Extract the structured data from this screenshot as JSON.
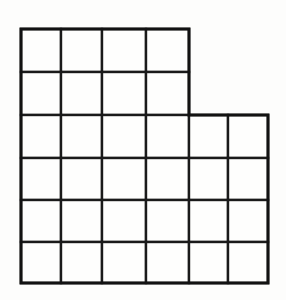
{
  "figure": {
    "name": "staircase-polyomino-grid",
    "background_color": "#fdfdfc",
    "line_color": "#1a1a1a",
    "line_width": 2.4,
    "cell_fill": "#fefefd",
    "total_cells": 32,
    "canvas": {
      "width": 286,
      "height": 300
    }
  },
  "chart_data": {
    "type": "table",
    "title": "",
    "xlabel": "",
    "ylabel": "",
    "grid": true,
    "columns": 6,
    "rows": 6,
    "column_edges_px": [
      21,
      61,
      102,
      146,
      189,
      228,
      268
    ],
    "row_edges_px": [
      29,
      72,
      115,
      158,
      200,
      242,
      283
    ],
    "row_cell_counts": [
      4,
      4,
      6,
      6,
      6,
      6
    ],
    "cells": [
      {
        "row": 0,
        "col": 0,
        "x": 21,
        "y": 29,
        "w": 40,
        "h": 43
      },
      {
        "row": 0,
        "col": 1,
        "x": 61,
        "y": 29,
        "w": 41,
        "h": 43
      },
      {
        "row": 0,
        "col": 2,
        "x": 102,
        "y": 29,
        "w": 44,
        "h": 43
      },
      {
        "row": 0,
        "col": 3,
        "x": 146,
        "y": 29,
        "w": 43,
        "h": 43
      },
      {
        "row": 1,
        "col": 0,
        "x": 21,
        "y": 72,
        "w": 40,
        "h": 43
      },
      {
        "row": 1,
        "col": 1,
        "x": 61,
        "y": 72,
        "w": 41,
        "h": 43
      },
      {
        "row": 1,
        "col": 2,
        "x": 102,
        "y": 72,
        "w": 44,
        "h": 43
      },
      {
        "row": 1,
        "col": 3,
        "x": 146,
        "y": 72,
        "w": 43,
        "h": 43
      },
      {
        "row": 2,
        "col": 0,
        "x": 21,
        "y": 115,
        "w": 40,
        "h": 43
      },
      {
        "row": 2,
        "col": 1,
        "x": 61,
        "y": 115,
        "w": 41,
        "h": 43
      },
      {
        "row": 2,
        "col": 2,
        "x": 102,
        "y": 115,
        "w": 44,
        "h": 43
      },
      {
        "row": 2,
        "col": 3,
        "x": 146,
        "y": 115,
        "w": 43,
        "h": 43
      },
      {
        "row": 2,
        "col": 4,
        "x": 189,
        "y": 115,
        "w": 39,
        "h": 43
      },
      {
        "row": 2,
        "col": 5,
        "x": 228,
        "y": 115,
        "w": 40,
        "h": 43
      },
      {
        "row": 3,
        "col": 0,
        "x": 21,
        "y": 158,
        "w": 40,
        "h": 42
      },
      {
        "row": 3,
        "col": 1,
        "x": 61,
        "y": 158,
        "w": 41,
        "h": 42
      },
      {
        "row": 3,
        "col": 2,
        "x": 102,
        "y": 158,
        "w": 44,
        "h": 42
      },
      {
        "row": 3,
        "col": 3,
        "x": 146,
        "y": 158,
        "w": 43,
        "h": 42
      },
      {
        "row": 3,
        "col": 4,
        "x": 189,
        "y": 158,
        "w": 39,
        "h": 42
      },
      {
        "row": 3,
        "col": 5,
        "x": 228,
        "y": 158,
        "w": 40,
        "h": 42
      },
      {
        "row": 4,
        "col": 0,
        "x": 21,
        "y": 200,
        "w": 40,
        "h": 42
      },
      {
        "row": 4,
        "col": 1,
        "x": 61,
        "y": 200,
        "w": 41,
        "h": 42
      },
      {
        "row": 4,
        "col": 2,
        "x": 102,
        "y": 200,
        "w": 44,
        "h": 42
      },
      {
        "row": 4,
        "col": 3,
        "x": 146,
        "y": 200,
        "w": 43,
        "h": 42
      },
      {
        "row": 4,
        "col": 4,
        "x": 189,
        "y": 200,
        "w": 39,
        "h": 42
      },
      {
        "row": 4,
        "col": 5,
        "x": 228,
        "y": 200,
        "w": 40,
        "h": 42
      },
      {
        "row": 5,
        "col": 0,
        "x": 21,
        "y": 242,
        "w": 40,
        "h": 41
      },
      {
        "row": 5,
        "col": 1,
        "x": 61,
        "y": 242,
        "w": 41,
        "h": 41
      },
      {
        "row": 5,
        "col": 2,
        "x": 102,
        "y": 242,
        "w": 44,
        "h": 41
      },
      {
        "row": 5,
        "col": 3,
        "x": 146,
        "y": 242,
        "w": 43,
        "h": 41
      },
      {
        "row": 5,
        "col": 4,
        "x": 189,
        "y": 242,
        "w": 39,
        "h": 41
      },
      {
        "row": 5,
        "col": 5,
        "x": 228,
        "y": 242,
        "w": 40,
        "h": 41
      }
    ],
    "outline_path": "M 21 29 L 189 29 L 189 115 L 268 115 L 268 283 L 21 283 Z"
  }
}
